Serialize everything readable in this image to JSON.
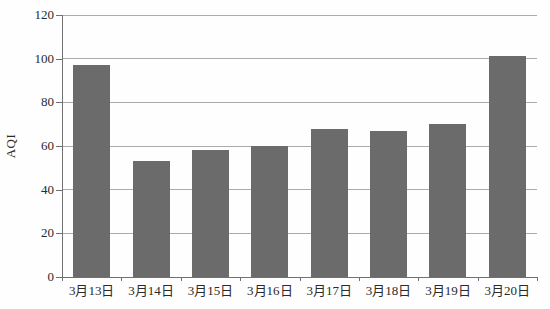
{
  "chart_data": {
    "type": "bar",
    "title": "",
    "categories": [
      "3月13日",
      "3月14日",
      "3月15日",
      "3月16日",
      "3月17日",
      "3月18日",
      "3月19日",
      "3月20日"
    ],
    "values": [
      97,
      53,
      58,
      60,
      68,
      67,
      70,
      101
    ],
    "xlabel": "",
    "ylabel": "AQI",
    "ylim": [
      0,
      120
    ],
    "ytick_step": 20,
    "grid": true,
    "legend": "none",
    "colors": {
      "bar": "#6b6b6b",
      "gridline": "#ababab",
      "axis": "#707070",
      "text": "#2a2a2a",
      "background": "#fefefe"
    }
  }
}
